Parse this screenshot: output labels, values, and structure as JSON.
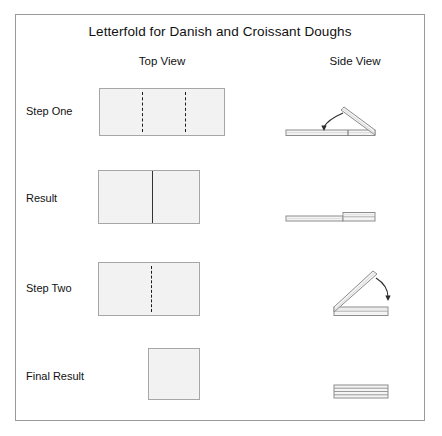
{
  "diagram": {
    "title": "Letterfold for Danish and Croissant Doughs",
    "columns": [
      {
        "key": "top",
        "label": "Top View"
      },
      {
        "key": "side",
        "label": "Side View"
      }
    ],
    "rows": [
      {
        "label": "Step One",
        "top_view": "rectangle-with-two-dashed-fold-lines",
        "side_view": "flat-strip-with-right-flap-raised-and-fold-arrow"
      },
      {
        "label": "Result",
        "top_view": "rectangle-with-one-solid-edge-line",
        "side_view": "flat-strip-with-doubled-right-section"
      },
      {
        "label": "Step Two",
        "top_view": "rectangle-with-one-dashed-fold-line",
        "side_view": "doubled-strip-with-left-flap-raised-and-fold-arrow"
      },
      {
        "label": "Final Result",
        "top_view": "small-square-plain",
        "side_view": "four-layer-stacked-bar"
      }
    ],
    "colors": {
      "frame_border": "#9a9a9a",
      "sheet_fill": "#f2f2f2",
      "sheet_border": "#a6a6a6",
      "fold_line": "#1c1c1c",
      "crease_line": "#333333",
      "strip_fill": "#f4f4f4",
      "strip_border": "#8c8c8c",
      "arrow": "#2b2b2b"
    }
  }
}
